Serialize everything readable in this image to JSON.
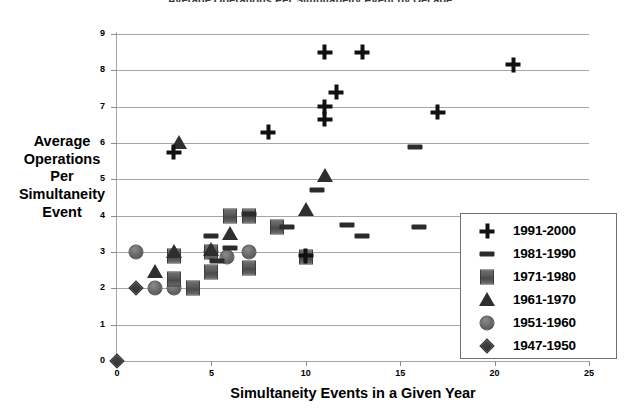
{
  "chart_data": {
    "type": "scatter",
    "title": "Average Operations Per Simultaneity Event by Decade",
    "xlabel": "Simultaneity Events in a Given Year",
    "ylabel": "Average Operations Per Simultaneity Event",
    "xlim": [
      0,
      25
    ],
    "ylim": [
      0,
      9
    ],
    "xticks": [
      "0",
      "5",
      "10",
      "15",
      "20",
      "25"
    ],
    "xtick_values": [
      0,
      5,
      10,
      15,
      20,
      25
    ],
    "yticks": [
      "0",
      "1",
      "2",
      "3",
      "4",
      "5",
      "6",
      "7",
      "8",
      "9"
    ],
    "ytick_values": [
      0,
      1,
      2,
      3,
      4,
      5,
      6,
      7,
      8,
      9
    ],
    "grid": "horizontal",
    "legend_position": "bottom-right",
    "series": [
      {
        "name": "1991-2000",
        "marker": "plus",
        "color": "#111111",
        "points": [
          {
            "x": 3,
            "y": 5.75
          },
          {
            "x": 8,
            "y": 6.3
          },
          {
            "x": 10,
            "y": 2.9
          },
          {
            "x": 11,
            "y": 8.5
          },
          {
            "x": 11,
            "y": 7.0
          },
          {
            "x": 11,
            "y": 6.65
          },
          {
            "x": 11.6,
            "y": 7.4
          },
          {
            "x": 13,
            "y": 8.5
          },
          {
            "x": 17,
            "y": 6.85
          },
          {
            "x": 21,
            "y": 8.15
          }
        ]
      },
      {
        "name": "1981-1990",
        "marker": "dash",
        "color": "#2b2b2b",
        "points": [
          {
            "x": 5,
            "y": 3.45
          },
          {
            "x": 5.3,
            "y": 2.75
          },
          {
            "x": 6,
            "y": 3.1
          },
          {
            "x": 7,
            "y": 4.05
          },
          {
            "x": 9,
            "y": 3.7
          },
          {
            "x": 10.6,
            "y": 4.7
          },
          {
            "x": 12.2,
            "y": 3.75
          },
          {
            "x": 13,
            "y": 3.45
          },
          {
            "x": 15.8,
            "y": 5.9
          },
          {
            "x": 16,
            "y": 3.7
          }
        ]
      },
      {
        "name": "1971-1980",
        "marker": "square",
        "color": "#5d5d5d",
        "points": [
          {
            "x": 3,
            "y": 2.9
          },
          {
            "x": 3,
            "y": 2.25
          },
          {
            "x": 4,
            "y": 2.0
          },
          {
            "x": 5,
            "y": 2.45
          },
          {
            "x": 5,
            "y": 3.0
          },
          {
            "x": 6,
            "y": 4.0
          },
          {
            "x": 7,
            "y": 4.0
          },
          {
            "x": 7,
            "y": 2.55
          },
          {
            "x": 8.5,
            "y": 3.7
          },
          {
            "x": 10,
            "y": 2.85
          }
        ]
      },
      {
        "name": "1961-1970",
        "marker": "triangle",
        "color": "#2e2e2e",
        "points": [
          {
            "x": 2,
            "y": 2.45
          },
          {
            "x": 3,
            "y": 3.0
          },
          {
            "x": 3.3,
            "y": 6.0
          },
          {
            "x": 5,
            "y": 3.05
          },
          {
            "x": 6,
            "y": 3.5
          },
          {
            "x": 10,
            "y": 4.15
          },
          {
            "x": 11,
            "y": 5.1
          }
        ]
      },
      {
        "name": "1951-1960",
        "marker": "circle",
        "color": "#6d6d6d",
        "points": [
          {
            "x": 1,
            "y": 3.0
          },
          {
            "x": 2,
            "y": 2.0
          },
          {
            "x": 3,
            "y": 2.0
          },
          {
            "x": 5,
            "y": 3.0
          },
          {
            "x": 5.8,
            "y": 2.85
          },
          {
            "x": 7,
            "y": 3.0
          }
        ]
      },
      {
        "name": "1947-1950",
        "marker": "diamond",
        "color": "#3a3a3a",
        "points": [
          {
            "x": 0,
            "y": 0.0
          },
          {
            "x": 1,
            "y": 2.0
          }
        ]
      }
    ]
  }
}
